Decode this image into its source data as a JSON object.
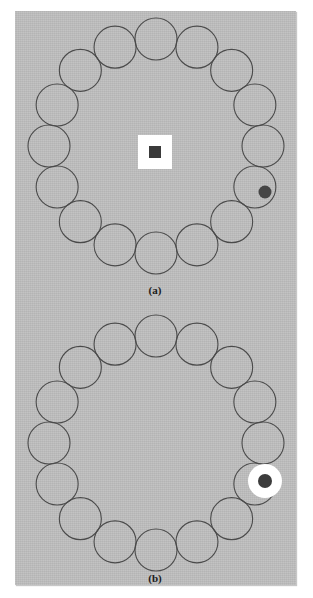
{
  "figure": {
    "type": "experimental-stimulus-diagram",
    "background_color": "#ffffff",
    "panel": {
      "color": "#bdbdbd",
      "x": 15,
      "y": 11,
      "width": 281,
      "height": 574
    },
    "panels": [
      {
        "id": "a",
        "label": "(a)",
        "label_x": 155,
        "label_y": 284,
        "ring": {
          "center_x": 156,
          "center_y": 146,
          "radius": 107,
          "item_count": 16,
          "item_radius": 21,
          "stroke_color": "#4a4a4a",
          "stroke_width": 1.1,
          "start_angle_deg": -90
        },
        "fixation": {
          "shape": "square",
          "outer_color": "#ffffff",
          "outer_size": 34,
          "inner_color": "#3a3a3a",
          "inner_size": 12,
          "x": 155,
          "y": 152
        },
        "target": {
          "shape": "dot-in-ring",
          "index": 12,
          "dot_color": "#464646",
          "dot_radius": 6.5,
          "x": 265,
          "y": 192
        }
      },
      {
        "id": "b",
        "label": "(b)",
        "label_x": 155,
        "label_y": 572,
        "ring": {
          "center_x": 156,
          "center_y": 443,
          "radius": 107,
          "item_count": 16,
          "item_radius": 21,
          "stroke_color": "#4a4a4a",
          "stroke_width": 1.1,
          "start_angle_deg": -90
        },
        "fixation": null,
        "target": {
          "shape": "dot-on-white-disk",
          "index": 12,
          "disk_color": "#ffffff",
          "disk_radius": 17,
          "dot_color": "#3c3c3c",
          "dot_radius": 7,
          "x": 265,
          "y": 481
        }
      }
    ],
    "bleed_text": [
      {
        "text": "showing  the  array  of  rings  used",
        "x": 22,
        "y": 52
      },
      {
        "text": "in  the  search  task  for  each  of",
        "x": 30,
        "y": 104
      },
      {
        "text": "the  two  conditions  presented",
        "x": 44,
        "y": 160
      },
      {
        "text": "observers  were  asked  to  report",
        "x": 26,
        "y": 214
      },
      {
        "text": "whether  the  target  dot  appeared",
        "x": 34,
        "y": 268
      },
      {
        "text": "left  or  right  of  the  fixation",
        "x": 40,
        "y": 330
      },
      {
        "text": "marker  in  the  centre  of  display",
        "x": 24,
        "y": 392
      },
      {
        "text": "across  a  block  of  trials",
        "x": 52,
        "y": 452
      },
      {
        "text": "mean  reaction  time  values",
        "x": 44,
        "y": 514
      }
    ]
  }
}
